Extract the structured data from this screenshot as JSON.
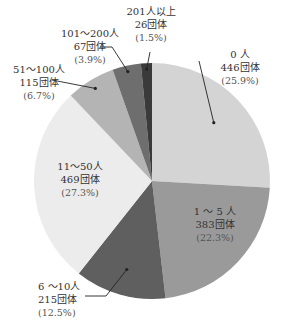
{
  "chart_data": {
    "type": "pie",
    "title": "",
    "start_angle": "12 o'clock, clockwise",
    "categories": [
      "0人",
      "1～5人",
      "6～10人",
      "11～50人",
      "51～100人",
      "101～200人",
      "201人以上"
    ],
    "values": [
      446,
      383,
      215,
      469,
      115,
      67,
      26
    ],
    "percents": [
      25.9,
      22.3,
      12.5,
      27.3,
      6.7,
      3.9,
      1.5
    ],
    "unit": "団体",
    "colors": [
      "#d4d4d4",
      "#9a9a9a",
      "#5f5f5f",
      "#ececec",
      "#b4b4b4",
      "#6e6e6e",
      "#3a3a3a"
    ]
  },
  "labels": [
    {
      "name": "0 人",
      "count": "446団体",
      "pct": "(25.9%)"
    },
    {
      "name": "1 ～ 5 人",
      "count": "383団体",
      "pct": "(22.3%)"
    },
    {
      "name": "6 ～10人",
      "count": "215団体",
      "pct": "(12.5%)"
    },
    {
      "name": "11～50人",
      "count": "469団体",
      "pct": "(27.3%)"
    },
    {
      "name": "51～100人",
      "count": "115団体",
      "pct": "(6.7%)"
    },
    {
      "name": "101～200人",
      "count": "67団体",
      "pct": "(3.9%)"
    },
    {
      "name": "201人以上",
      "count": "26団体",
      "pct": "(1.5%)"
    }
  ]
}
